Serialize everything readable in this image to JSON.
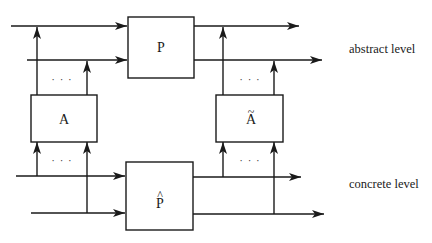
{
  "diagram": {
    "boxes": {
      "P": {
        "label": "P"
      },
      "A": {
        "label": "A"
      },
      "A_tilde": {
        "label": "A",
        "accent": "~"
      },
      "P_hat": {
        "label": "P",
        "accent": "^"
      }
    },
    "levels": {
      "abstract": "abstract level",
      "concrete": "concrete level"
    },
    "ellipsis": "· · ·",
    "colors": {
      "stroke": "#1a1a1a",
      "background": "#ffffff"
    }
  }
}
